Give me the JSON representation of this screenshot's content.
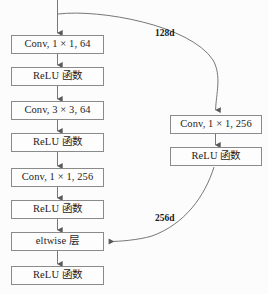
{
  "diagram": {
    "type": "flowchart",
    "background_color": "#fcfcfc",
    "box_border_color": "#8a8a8a",
    "edge_color": "#6f6f6f",
    "text_color": "#1d1d1d",
    "main_branch": {
      "name": "main-branch",
      "nodes": [
        {
          "id": "conv1",
          "label": "Conv, 1 × 1, 64",
          "x": 11,
          "y": 35
        },
        {
          "id": "relu1",
          "label": "ReLU 函数",
          "x": 11,
          "y": 67
        },
        {
          "id": "conv2",
          "label": "Conv, 3 × 3, 64",
          "x": 11,
          "y": 101
        },
        {
          "id": "relu2",
          "label": "ReLU 函数",
          "x": 11,
          "y": 133
        },
        {
          "id": "conv3",
          "label": "Conv, 1 × 1, 256",
          "x": 11,
          "y": 168
        },
        {
          "id": "relu3",
          "label": "ReLU 函数",
          "x": 11,
          "y": 200
        },
        {
          "id": "eltwise",
          "label": "eltwise 层",
          "x": 11,
          "y": 232
        },
        {
          "id": "relu4",
          "label": "ReLU 函数",
          "x": 11,
          "y": 266
        }
      ]
    },
    "shortcut_branch": {
      "name": "shortcut-branch",
      "nodes": [
        {
          "id": "conv_shortcut",
          "label": "Conv, 1 × 1, 256",
          "x": 170,
          "y": 115
        },
        {
          "id": "relu_shortcut",
          "label": "ReLU 函数",
          "x": 170,
          "y": 147
        }
      ]
    },
    "edge_labels": [
      {
        "id": "label_128d",
        "text": "128d",
        "x": 155,
        "y": 29
      },
      {
        "id": "label_256d",
        "text": "256d",
        "x": 155,
        "y": 214
      }
    ]
  }
}
